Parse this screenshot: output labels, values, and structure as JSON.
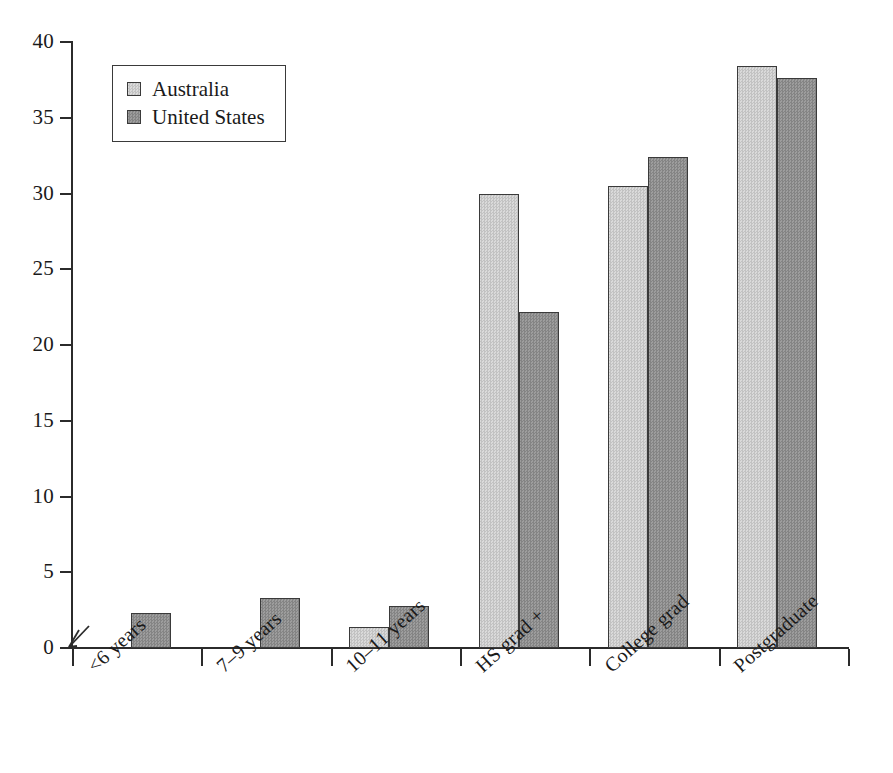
{
  "chart_data": {
    "type": "bar",
    "title": "",
    "subtitle": "",
    "xlabel": "",
    "ylabel": "",
    "ylim": [
      0,
      40
    ],
    "yticks": [
      0,
      5,
      10,
      15,
      20,
      25,
      30,
      35,
      40
    ],
    "ytick_labels": [
      "0",
      "5",
      "10",
      "15",
      "20",
      "25",
      "30",
      "35",
      "40"
    ],
    "grid": false,
    "legend_position": "upper left",
    "axis_break_at_origin": true,
    "categories": [
      "<6 years",
      "7–9 years",
      "10–11 years",
      "HS grad +",
      "College grad",
      "Postgraduate"
    ],
    "series": [
      {
        "name": "Australia",
        "color": "#cccccc",
        "values": [
          0,
          0,
          1.4,
          30.0,
          30.5,
          38.4
        ]
      },
      {
        "name": "United States",
        "color": "#909090",
        "values": [
          2.3,
          3.3,
          2.8,
          22.2,
          32.4,
          37.6
        ]
      }
    ]
  },
  "legend": {
    "entries": [
      {
        "label": "Australia",
        "swatch": "series-au"
      },
      {
        "label": "United States",
        "swatch": "series-us"
      }
    ]
  },
  "colors": {
    "axis": "#2b2b2b",
    "bar_border": "#3a3a3a",
    "series_australia": "#cccccc",
    "series_united_states": "#909090",
    "background": "#ffffff"
  }
}
